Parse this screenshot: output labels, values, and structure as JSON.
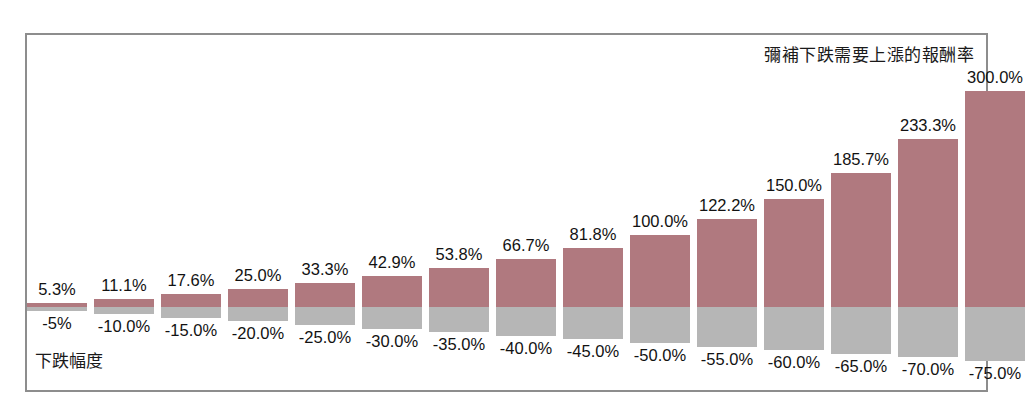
{
  "chart": {
    "title": "彌補下跌需要上漲的報酬率",
    "axis_caption": "下跌幅度"
  },
  "colors": {
    "gain_bar": "#b0797f",
    "loss_bar": "#b6b6b6",
    "frame": "#8d8d8d",
    "text": "#121212",
    "background": "#ffffff"
  },
  "chart_data": {
    "type": "bar",
    "title": "彌補下跌需要上漲的報酬率",
    "xlabel": "下跌幅度",
    "ylabel": "",
    "grid": false,
    "legend": "none",
    "orientation": "vertical",
    "baseline": 0,
    "ylim": [
      -75,
      300
    ],
    "categories": [
      "-5%",
      "-10.0%",
      "-15.0%",
      "-20.0%",
      "-25.0%",
      "-30.0%",
      "-35.0%",
      "-40.0%",
      "-45.0%",
      "-50.0%",
      "-55.0%",
      "-60.0%",
      "-65.0%",
      "-70.0%",
      "-75.0%"
    ],
    "series": [
      {
        "name": "彌補下跌需要上漲的報酬率",
        "color": "#b0797f",
        "values": [
          5.3,
          11.1,
          17.6,
          25.0,
          33.3,
          42.9,
          53.8,
          66.7,
          81.8,
          100.0,
          122.2,
          150.0,
          185.7,
          233.3,
          300.0
        ],
        "labels": [
          "5.3%",
          "11.1%",
          "17.6%",
          "25.0%",
          "33.3%",
          "42.9%",
          "53.8%",
          "66.7%",
          "81.8%",
          "100.0%",
          "122.2%",
          "150.0%",
          "185.7%",
          "233.3%",
          "300.0%"
        ]
      },
      {
        "name": "下跌幅度",
        "color": "#b6b6b6",
        "values": [
          -5,
          -10,
          -15,
          -20,
          -25,
          -30,
          -35,
          -40,
          -45,
          -50,
          -55,
          -60,
          -65,
          -70,
          -75
        ],
        "labels": [
          "-5%",
          "-10.0%",
          "-15.0%",
          "-20.0%",
          "-25.0%",
          "-30.0%",
          "-35.0%",
          "-40.0%",
          "-45.0%",
          "-50.0%",
          "-55.0%",
          "-60.0%",
          "-65.0%",
          "-70.0%",
          "-75.0%"
        ]
      }
    ]
  },
  "layout": {
    "bar_width": 60,
    "bar_pitch": 67,
    "first_bar_left": 0,
    "baseline_y": 272,
    "px_per_percent": 0.72
  }
}
